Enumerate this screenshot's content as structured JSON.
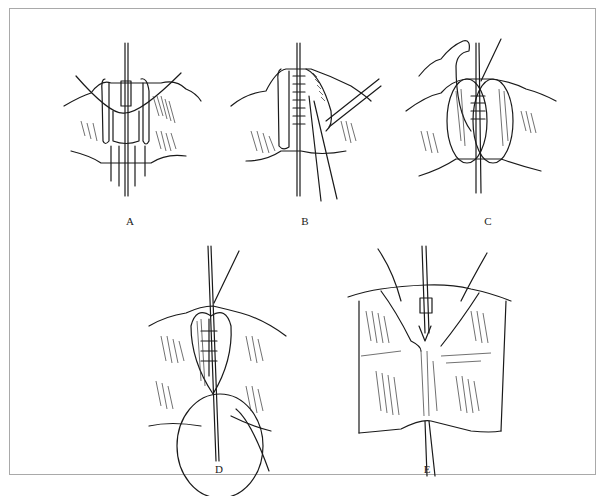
{
  "figure": {
    "frame_color": "#a9a9a9",
    "ink_color": "#1a1a1a",
    "panels": [
      {
        "id": "A",
        "label": "A",
        "label_pos": [
          129,
          221
        ]
      },
      {
        "id": "B",
        "label": "B",
        "label_pos": [
          304,
          221
        ]
      },
      {
        "id": "C",
        "label": "C",
        "label_pos": [
          487,
          221
        ]
      },
      {
        "id": "D",
        "label": "D",
        "label_pos": [
          218,
          469
        ]
      },
      {
        "id": "E",
        "label": "E",
        "label_pos": [
          426,
          469
        ]
      }
    ]
  }
}
